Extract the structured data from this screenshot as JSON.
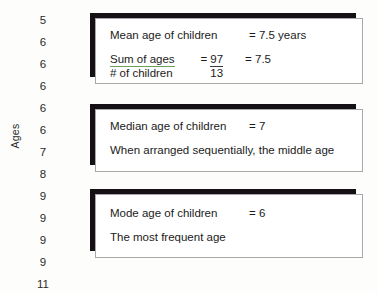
{
  "axis": {
    "label": "Ages",
    "values": [
      "5",
      "6",
      "6",
      "6",
      "6",
      "6",
      "7",
      "8",
      "9",
      "9",
      "9",
      "9",
      "11"
    ]
  },
  "boxes": {
    "mean": {
      "label": "Mean age of children",
      "result": "= 7.5 years",
      "numerator": "Sum of ages",
      "denominator": "# of children",
      "equals": "=",
      "frac_numerator": "97",
      "frac_denominator": "13",
      "final": "= 7.5"
    },
    "median": {
      "label": "Median age of children",
      "result": "= 7",
      "note": "When arranged sequentially, the middle age"
    },
    "mode": {
      "label": "Mode age of children",
      "result": "= 6",
      "note": "The most frequent age"
    }
  },
  "colors": {
    "background": "#fdfdfb",
    "box_fill": "#ffffff",
    "box_border": "#a8a8a8",
    "box_shadow": "#151016",
    "text": "#1b1b1b",
    "fraction_rule": "#6f9f5e"
  }
}
